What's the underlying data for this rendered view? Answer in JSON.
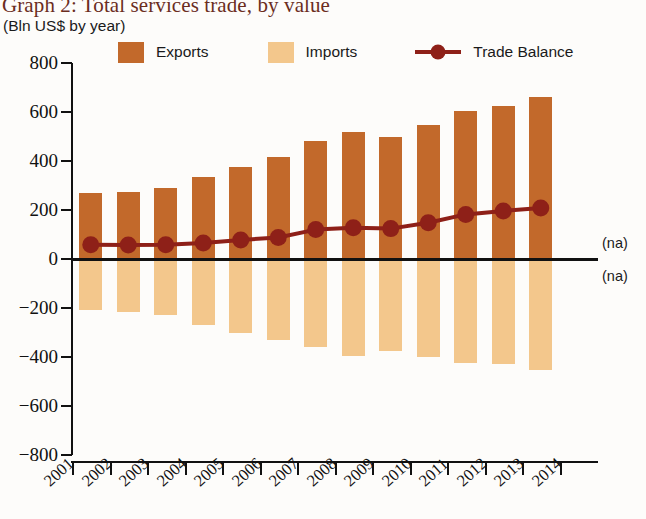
{
  "title": "Graph 2: Total services trade, by value",
  "subtitle": "(Bln US$ by year)",
  "colors": {
    "exports": "#c2692b",
    "imports": "#f3c78c",
    "trade_balance": "#8e2018",
    "title_text": "#6b2d1e",
    "axis": "#111111"
  },
  "legend": {
    "items": [
      {
        "label": "Exports",
        "icon": "square-swatch",
        "color": "#c2692b"
      },
      {
        "label": "Imports",
        "icon": "square-swatch",
        "color": "#f3c78c"
      },
      {
        "label": "Trade Balance",
        "icon": "line-marker",
        "color": "#8e2018"
      }
    ]
  },
  "annotations": [
    {
      "text": "(na)",
      "position": "above-zero-right"
    },
    {
      "text": "(na)",
      "position": "below-zero-right"
    }
  ],
  "chart_data": {
    "type": "bar",
    "title": "Graph 2: Total services trade, by value",
    "subtitle": "(Bln US$ by year)",
    "xlabel": "",
    "ylabel": "Bln US$ by year",
    "ylim": [
      -800,
      800
    ],
    "ytick_values": [
      800,
      600,
      400,
      200,
      0,
      -200,
      -400,
      -600,
      -800
    ],
    "ytick_labels": [
      "800",
      "600",
      "400",
      "200",
      "0",
      "−200",
      "−400",
      "−600",
      "−800"
    ],
    "grid": false,
    "legend_position": "top",
    "categories": [
      "2001",
      "2002",
      "2003",
      "2004",
      "2005",
      "2006",
      "2007",
      "2008",
      "2009",
      "2010",
      "2011",
      "2012",
      "2013"
    ],
    "xtick_labels": [
      "2001",
      "2002",
      "2003",
      "2004",
      "2005",
      "2006",
      "2007",
      "2008",
      "2009",
      "2010",
      "2011",
      "2012",
      "2013",
      "2014"
    ],
    "series": [
      {
        "name": "Exports",
        "type": "bar",
        "color": "#c2692b",
        "values": [
          270,
          275,
          290,
          335,
          375,
          415,
          480,
          520,
          500,
          545,
          605,
          625,
          660
        ]
      },
      {
        "name": "Imports",
        "type": "bar",
        "color": "#f3c78c",
        "values": [
          -210,
          -215,
          -230,
          -270,
          -300,
          -330,
          -360,
          -395,
          -375,
          -400,
          -425,
          -430,
          -455
        ]
      },
      {
        "name": "Trade Balance",
        "type": "line",
        "color": "#8e2018",
        "values": [
          58,
          57,
          58,
          65,
          78,
          88,
          120,
          128,
          124,
          148,
          182,
          196,
          208
        ]
      }
    ]
  }
}
